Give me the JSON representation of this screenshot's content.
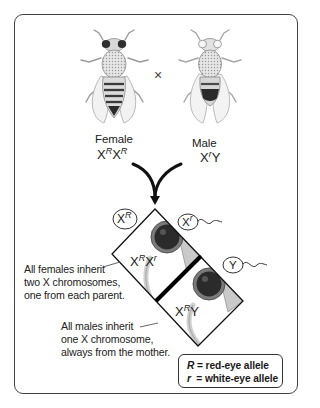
{
  "figure": {
    "parents": {
      "female": {
        "label": "Female",
        "genotype_base1": "X",
        "genotype_sup1": "R",
        "genotype_base2": "X",
        "genotype_sup2": "R",
        "eye_color": "red"
      },
      "male": {
        "label": "Male",
        "genotype_base1": "X",
        "genotype_sup1": "r",
        "genotype_base2": "Y",
        "eye_color": "white"
      },
      "cross_symbol": "×"
    },
    "gametes": {
      "egg": {
        "base": "X",
        "sup": "R"
      },
      "sperm": [
        {
          "base": "X",
          "sup": "r"
        },
        {
          "base": "Y",
          "sup": ""
        }
      ]
    },
    "offspring": [
      {
        "sex": "female",
        "genotype_base1": "X",
        "genotype_sup1": "R",
        "genotype_base2": "X",
        "genotype_sup2": "r",
        "note_lines": [
          "All females inherit",
          "two X chromosomes,",
          "one from each parent."
        ]
      },
      {
        "sex": "male",
        "genotype_base1": "X",
        "genotype_sup1": "R",
        "genotype_base2": "Y",
        "note_lines": [
          "All males inherit",
          "one X chromosome,",
          "always from the mother."
        ]
      }
    ],
    "legend": {
      "row1_symbol": "R",
      "row1_text": " = red-eye allele",
      "row2_symbol": "r",
      "row2_text": "  = white-eye allele"
    },
    "colors": {
      "frame": "#444444",
      "ink": "#1a1a1a",
      "divider": "#000000",
      "fly_body": "#bdbdbd",
      "eye_dark": "#2a2a2a"
    }
  }
}
